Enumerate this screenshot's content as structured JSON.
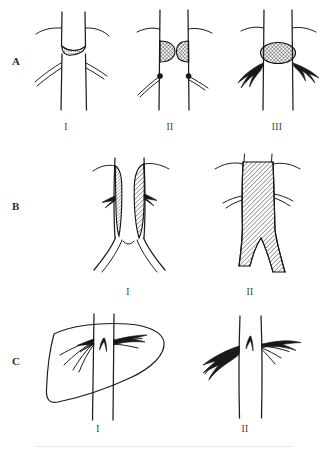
{
  "figure": {
    "width": 328,
    "height": 450,
    "background": "#ffffff",
    "ink_color": "#1c1c1c",
    "hatch_color": "#2a2a2a"
  },
  "rows": [
    {
      "id": "row-a",
      "label": "A",
      "label_x": 12,
      "label_y": 62,
      "description": "Progressive aortic plaque / stenosis stages",
      "panels": [
        {
          "id": "a1",
          "numeral": "I",
          "numeral_x": 66,
          "numeral_y": 128,
          "caption": "Eccentric shelf-like plaque at aortic bifurcation",
          "lesion": "crescent-plaque"
        },
        {
          "id": "a2",
          "numeral": "II",
          "numeral_x": 170,
          "numeral_y": 128,
          "caption": "Paired opposing hemispheric plaques narrowing lumen",
          "lesion": "paired-hemispheric-plaques"
        },
        {
          "id": "a3",
          "numeral": "III",
          "numeral_x": 277,
          "numeral_y": 128,
          "caption": "Large occluding cross-hatched plaque with collateral branches",
          "lesion": "occlusive-ellipse"
        }
      ]
    },
    {
      "id": "row-b",
      "label": "B",
      "label_x": 12,
      "label_y": 207,
      "description": "Aortoiliac wall thrombus versus complete occlusion",
      "panels": [
        {
          "id": "b1",
          "numeral": "I",
          "numeral_x": 128,
          "numeral_y": 293,
          "caption": "Mural hatched thrombus lining both aortic walls",
          "lesion": "bilateral-mural-thrombus"
        },
        {
          "id": "b2",
          "numeral": "II",
          "numeral_x": 250,
          "numeral_y": 293,
          "caption": "Complete hatched occlusion of infrarenal aorta to bifurcation",
          "lesion": "total-occlusion"
        }
      ]
    },
    {
      "id": "row-c",
      "label": "C",
      "label_x": 12,
      "label_y": 362,
      "description": "Renal artery branch lesions with and without organ outline",
      "panels": [
        {
          "id": "c1",
          "numeral": "I",
          "numeral_x": 98,
          "numeral_y": 430,
          "caption": "Branch vessels within organ silhouette crossing the aorta",
          "lesion": "intra-organ-branches"
        },
        {
          "id": "c2",
          "numeral": "II",
          "numeral_x": 245,
          "numeral_y": 430,
          "caption": "Isolated branch vessel lesions at aortic ostia",
          "lesion": "ostial-branch-lesions"
        }
      ]
    }
  ]
}
